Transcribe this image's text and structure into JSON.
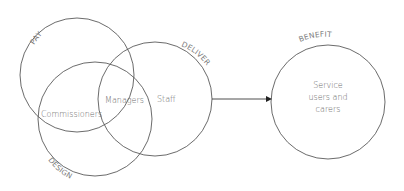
{
  "diagram": {
    "circles": {
      "pay": {
        "label": "PAY"
      },
      "design": {
        "label": "DESIGN"
      },
      "deliver": {
        "label": "DELIVER"
      },
      "benefit": {
        "label": "BENEFIT"
      }
    },
    "regions": {
      "commissioners": "Commissioners",
      "managers": "Managers",
      "staff": "Staff",
      "benefit_line1": "Service",
      "benefit_line2": "users and",
      "benefit_line3": "carers"
    },
    "arrow": {
      "from": "deliver",
      "to": "benefit"
    },
    "colors": {
      "stroke": "#5a5a5a",
      "text": "#6b6b6b"
    }
  }
}
